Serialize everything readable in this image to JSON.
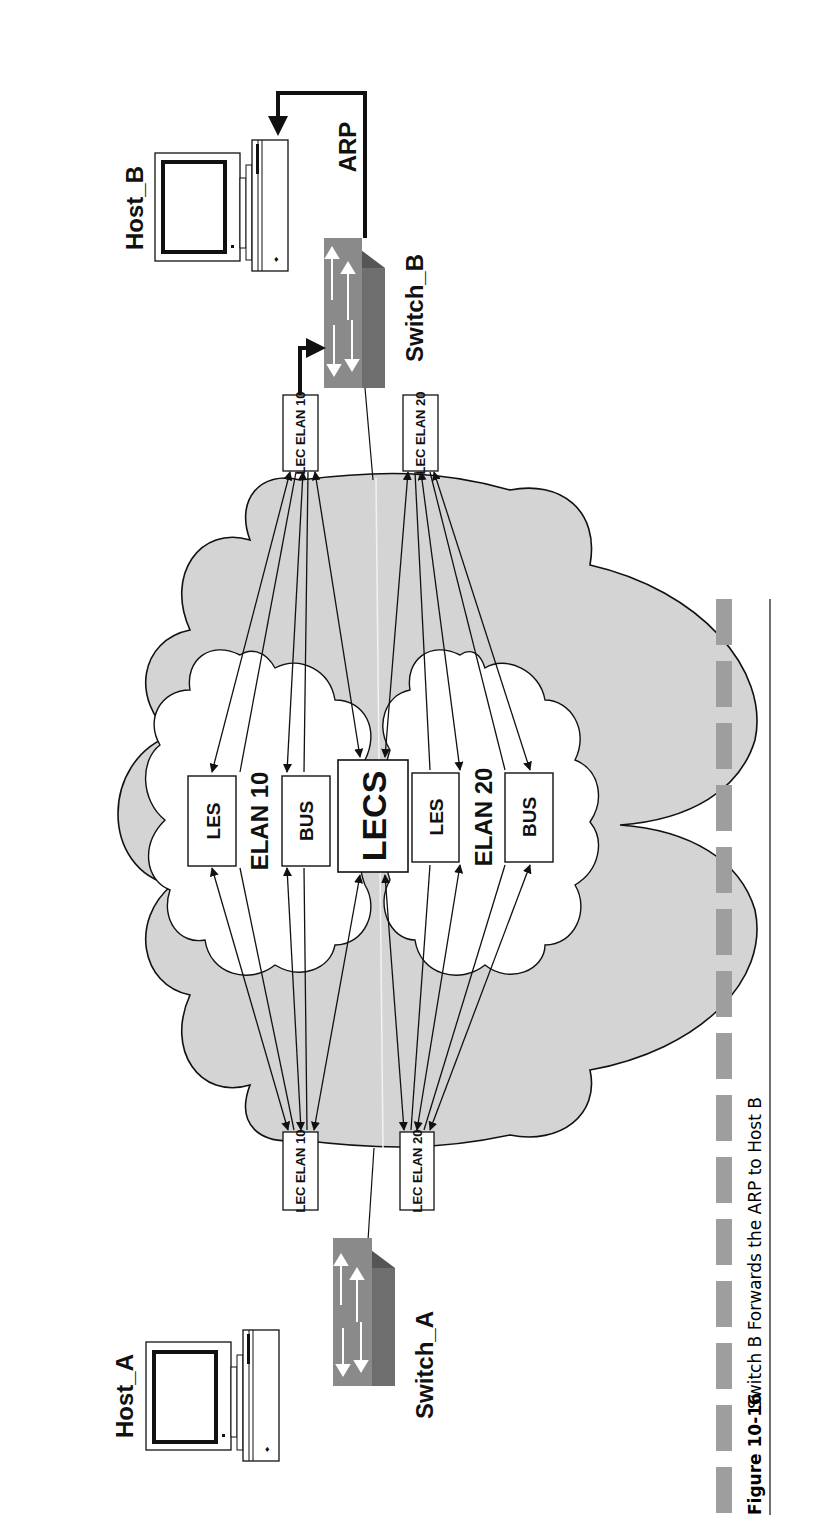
{
  "figure": {
    "number": "Figure 10-16",
    "caption": "Switch B Forwards the ARP to Host B"
  },
  "hosts": {
    "host_a": "Host_A",
    "host_b": "Host_B"
  },
  "switches": {
    "switch_a": "Switch_A",
    "switch_b": "Switch_B"
  },
  "arp_label": "ARP",
  "lec": {
    "top_elan10": "LEC ELAN 10",
    "top_elan20": "LEC ELAN 20",
    "bottom_elan10": "LEC ELAN 10",
    "bottom_elan20": "LEC ELAN 20"
  },
  "elans": {
    "elan10": {
      "name": "ELAN 10",
      "les": "LES",
      "bus": "BUS"
    },
    "elan20": {
      "name": "ELAN 20",
      "les": "LES",
      "bus": "BUS"
    }
  },
  "lecs": "LECS",
  "colors": {
    "cloud_fill": "#d4d4d4",
    "inner_cloud_fill": "#ffffff",
    "switch_face": "#8a8a8a",
    "switch_side": "#6e6e6e",
    "switch_top": "#555555",
    "caption_bar": "#9e9e9e",
    "line": "#111111"
  }
}
